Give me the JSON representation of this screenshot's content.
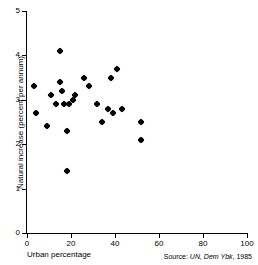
{
  "chart_data": {
    "type": "scatter",
    "title": "",
    "xlabel": "Urban percentage",
    "ylabel": "Natural increase (percent per annum)",
    "xlim": [
      0,
      100
    ],
    "ylim": [
      0,
      5
    ],
    "xticks": [
      0,
      20,
      40,
      60,
      80,
      100
    ],
    "yticks": [
      0,
      1,
      2,
      3,
      4,
      5
    ],
    "xtick_labels": [
      "0",
      "20",
      "40",
      "60",
      "80",
      "100"
    ],
    "ytick_labels": [
      "0",
      "1",
      "2",
      "3",
      "4",
      "5"
    ],
    "grid": false,
    "legend": null,
    "marker": "filled-diamond",
    "marker_color": "#000000",
    "points": [
      {
        "x": 3,
        "y": 3.3
      },
      {
        "x": 4,
        "y": 2.7
      },
      {
        "x": 9,
        "y": 2.4
      },
      {
        "x": 11,
        "y": 3.1
      },
      {
        "x": 13,
        "y": 2.9
      },
      {
        "x": 15,
        "y": 4.1
      },
      {
        "x": 15,
        "y": 3.4
      },
      {
        "x": 16,
        "y": 3.2
      },
      {
        "x": 17,
        "y": 2.9
      },
      {
        "x": 18,
        "y": 2.3
      },
      {
        "x": 18,
        "y": 1.4
      },
      {
        "x": 19,
        "y": 2.9
      },
      {
        "x": 21,
        "y": 3.0
      },
      {
        "x": 22,
        "y": 3.1
      },
      {
        "x": 26,
        "y": 3.5
      },
      {
        "x": 28,
        "y": 3.3
      },
      {
        "x": 32,
        "y": 2.9
      },
      {
        "x": 34,
        "y": 2.5
      },
      {
        "x": 37,
        "y": 2.8
      },
      {
        "x": 38,
        "y": 3.5
      },
      {
        "x": 39,
        "y": 2.7
      },
      {
        "x": 41,
        "y": 3.7
      },
      {
        "x": 43,
        "y": 2.8
      },
      {
        "x": 52,
        "y": 2.5
      },
      {
        "x": 52,
        "y": 2.1
      }
    ]
  },
  "source": {
    "prefix": "Source: ",
    "publication": "UN, Dem Ybk",
    "suffix": ", 1985",
    "full": "Source: UN, Dem Ybk, 1985"
  }
}
